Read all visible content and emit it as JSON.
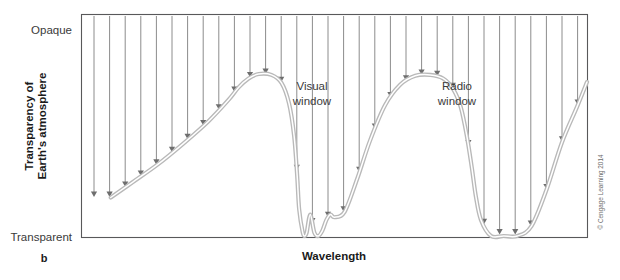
{
  "figure": {
    "panel_letter": "b",
    "credit": "© Cengage Learning 2014"
  },
  "axes": {
    "y_title_line1": "Transparency of",
    "y_title_line2": "Earth's atmosphere",
    "y_top_label": "Opaque",
    "y_bottom_label": "Transparent",
    "x_title": "Wavelength"
  },
  "annotations": {
    "visual_window_line1": "Visual",
    "visual_window_line2": "window",
    "radio_window_line1": "Radio",
    "radio_window_line2": "window"
  },
  "colors": {
    "curve": "#b9b9b9",
    "curve_highlight": "#ffffff",
    "ray": "#8c8c8c",
    "frame": "#58585a",
    "text": "#231f20",
    "background": "#ffffff"
  },
  "chart_data": {
    "type": "line",
    "title": "",
    "xlabel": "Wavelength",
    "ylabel": "Transparency of Earth's atmosphere",
    "ylim": [
      0,
      1
    ],
    "xlim": [
      0,
      1
    ],
    "grid": false,
    "legend": null,
    "y_tick_labels": [
      "Transparent",
      "Opaque"
    ],
    "y_tick_values": [
      0,
      1
    ],
    "x_tick_labels": [],
    "note": "Opacity curve of Earth's atmosphere versus wavelength. High curve = opaque (blocks radiation); curve touching the baseline = transparent window. Two atmospheric windows are marked: the visual window and the radio window. Vertical arrows represent incoming radiation stopped at the curve height, except inside the windows where arrows reach the ground.",
    "series": [
      {
        "name": "Atmospheric opacity",
        "x": [
          0.057,
          0.1,
          0.15,
          0.2,
          0.25,
          0.29,
          0.31,
          0.33,
          0.35,
          0.375,
          0.395,
          0.41,
          0.42,
          0.426,
          0.43,
          0.437,
          0.441,
          0.445,
          0.452,
          0.46,
          0.468,
          0.476,
          0.484,
          0.492,
          0.5,
          0.52,
          0.545,
          0.57,
          0.6,
          0.63,
          0.66,
          0.69,
          0.715,
          0.735,
          0.75,
          0.762,
          0.772,
          0.78,
          0.79,
          0.81,
          0.835,
          0.862,
          0.89,
          0.92,
          0.95,
          0.98,
          1.0
        ],
        "y": [
          0.215,
          0.3,
          0.4,
          0.515,
          0.64,
          0.76,
          0.83,
          0.88,
          0.905,
          0.9,
          0.855,
          0.74,
          0.56,
          0.34,
          0.15,
          0.02,
          0.0,
          0.02,
          0.12,
          0.02,
          0.0,
          0.03,
          0.09,
          0.12,
          0.105,
          0.135,
          0.32,
          0.53,
          0.73,
          0.845,
          0.895,
          0.9,
          0.88,
          0.82,
          0.72,
          0.56,
          0.38,
          0.22,
          0.09,
          0.0,
          0.0,
          0.0,
          0.055,
          0.26,
          0.52,
          0.72,
          0.86
        ]
      }
    ],
    "annotations": [
      {
        "label": "Visual window",
        "x": 0.44,
        "y": 0.7
      },
      {
        "label": "Radio window",
        "x": 0.72,
        "y": 0.7
      }
    ]
  }
}
